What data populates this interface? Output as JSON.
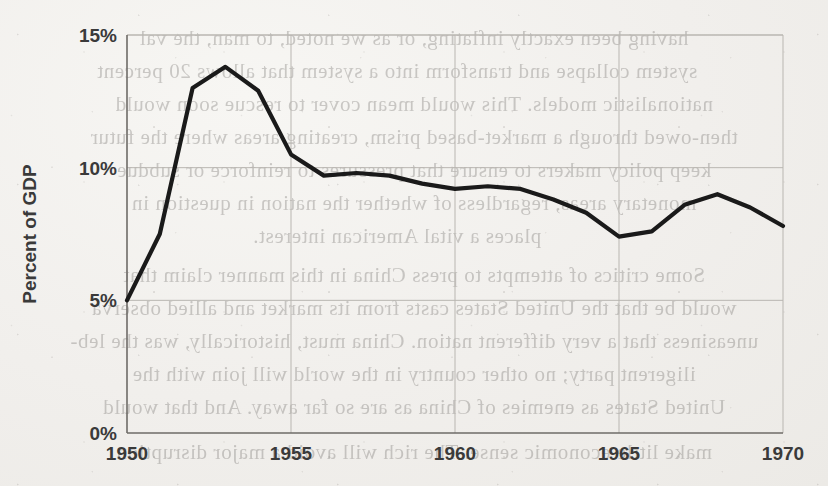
{
  "document": {
    "kind": "scanned-book-page",
    "bleed_through_lines": [
      "having been exactly inflating, or as we noted, to man, the val",
      "system collapse and transform into a system that allows 20 percent",
      "nationalistic models. This would mean cover to rescue soon would",
      "then-owed through a market-based prism, creating areas where the futur",
      "keep policy makers to ensure that pressures to reinforce or subdue",
      "monetary areas, regardless of whether the nation in question in",
      "places a vital American interest.",
      "Some critics of attempts to press China in this manner claim that",
      "would be that the United States casts from its market and allied observa",
      "uneasiness that a very different nation. China must, historically, was the leb-",
      "iligerent party; no other country in the world will join with the",
      "United States as enemies of China as are so far away. And that would",
      "make little economic sense. The rich will avoid a major disruption"
    ]
  },
  "chart_data": {
    "type": "line",
    "title": "",
    "xlabel": "",
    "ylabel": "Percent of GDP",
    "xlim": [
      1950,
      1970
    ],
    "ylim": [
      0,
      15
    ],
    "grid": true,
    "legend": "none",
    "line_color": "#1a1a1a",
    "x_tick_labels": [
      "1950",
      "1955",
      "1960",
      "1965",
      "1970"
    ],
    "x_ticks": [
      1950,
      1955,
      1960,
      1965,
      1970
    ],
    "y_tick_labels": [
      "0%",
      "5%",
      "10%",
      "15%"
    ],
    "y_ticks": [
      0,
      5,
      10,
      15
    ],
    "x": [
      1950,
      1951,
      1952,
      1953,
      1954,
      1955,
      1956,
      1957,
      1958,
      1959,
      1960,
      1961,
      1962,
      1963,
      1964,
      1965,
      1966,
      1967,
      1968,
      1969,
      1970
    ],
    "values": [
      5.0,
      7.5,
      13.0,
      13.8,
      12.9,
      10.5,
      9.7,
      9.8,
      9.7,
      9.4,
      9.2,
      9.3,
      9.2,
      8.8,
      8.3,
      7.4,
      7.6,
      8.6,
      9.0,
      8.5,
      7.8
    ],
    "series": [
      {
        "name": "Percent of GDP",
        "values": [
          5.0,
          7.5,
          13.0,
          13.8,
          12.9,
          10.5,
          9.7,
          9.8,
          9.7,
          9.4,
          9.2,
          9.3,
          9.2,
          8.8,
          8.3,
          7.4,
          7.6,
          8.6,
          9.0,
          8.5,
          7.8
        ]
      }
    ]
  },
  "colors": {
    "paper": "#f1efec",
    "ink": "#1a1a1a",
    "grid": "#b9b6b1",
    "tick_text": "#3a3a3a"
  }
}
